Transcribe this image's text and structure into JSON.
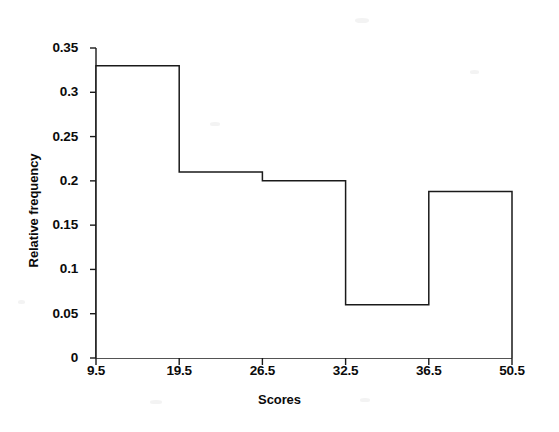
{
  "chart_data": {
    "type": "bar",
    "title": "",
    "subtitle": "",
    "xlabel": "Scores",
    "ylabel": "Relative frequency",
    "grid": false,
    "legend": false,
    "legend_position": "none",
    "style": "histogram-outline",
    "line_color": "#1a1a1a",
    "fill_color": "#ffffff",
    "background_color": "#ffffff",
    "xlim": [
      9.5,
      50.5
    ],
    "ylim": [
      0,
      0.35
    ],
    "x_axis_scale": "equal-width-bins",
    "bin_edges": [
      9.5,
      19.5,
      26.5,
      32.5,
      36.5,
      50.5
    ],
    "xtick_labels": [
      "9.5",
      "19.5",
      "26.5",
      "32.5",
      "36.5",
      "50.5"
    ],
    "ytick_labels": [
      "0",
      "0.05",
      "0.1",
      "0.15",
      "0.2",
      "0.25",
      "0.3",
      "0.35"
    ],
    "ytick_values": [
      0,
      0.05,
      0.1,
      0.15,
      0.2,
      0.25,
      0.3,
      0.35
    ],
    "categories": [
      "9.5-19.5",
      "19.5-26.5",
      "26.5-32.5",
      "32.5-36.5",
      "36.5-50.5"
    ],
    "values": [
      0.33,
      0.21,
      0.2,
      0.06,
      0.188
    ],
    "bars": [
      {
        "label": "9.5-19.5",
        "lower": 9.5,
        "upper": 19.5,
        "value": 0.33
      },
      {
        "label": "19.5-26.5",
        "lower": 19.5,
        "upper": 26.5,
        "value": 0.21
      },
      {
        "label": "26.5-32.5",
        "lower": 26.5,
        "upper": 32.5,
        "value": 0.2
      },
      {
        "label": "32.5-36.5",
        "lower": 32.5,
        "upper": 36.5,
        "value": 0.06
      },
      {
        "label": "36.5-50.5",
        "lower": 36.5,
        "upper": 50.5,
        "value": 0.188
      }
    ]
  },
  "axes": {
    "y_title": "Relative frequency",
    "x_title": "Scores"
  }
}
